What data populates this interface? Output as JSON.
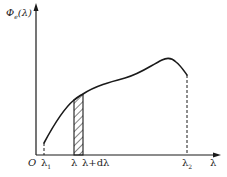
{
  "figure": {
    "type": "spectral-distribution-diagram",
    "y_axis_label": {
      "symbol": "Φ",
      "subscript": "e",
      "argument": "(λ)"
    },
    "x_axis_label": "λ",
    "origin_label": "O",
    "ticks": {
      "lambda1": {
        "symbol": "λ",
        "subscript": "1"
      },
      "lambda": "λ",
      "lambda_plus_d": "λ+dλ",
      "lambda2": {
        "symbol": "λ",
        "subscript": "2"
      }
    },
    "curve_description": "Spectral radiant flux curve rising from λ1, with a peak near λ2 then dropping slightly; a hatched strip between λ and λ+dλ under the curve; dashed vertical lines at λ1 and λ2.",
    "colors": {
      "line": "#1a1a1a",
      "background": "#ffffff"
    }
  }
}
